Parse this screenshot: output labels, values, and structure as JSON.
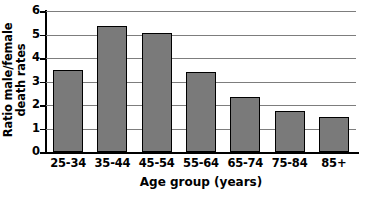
{
  "chart_data": {
    "type": "bar",
    "title": "",
    "xlabel": "Age group (years)",
    "ylabel": "Ratio male/female death rates",
    "ylabel_line1": "Ratio male/female",
    "ylabel_line2": "death rates",
    "categories": [
      "25-34",
      "35-44",
      "45-54",
      "55-64",
      "65-74",
      "75-84",
      "85+"
    ],
    "values": [
      3.5,
      5.35,
      5.05,
      3.4,
      2.35,
      1.75,
      1.5
    ],
    "ylim": [
      0,
      6
    ],
    "yticks": [
      0,
      1,
      2,
      3,
      4,
      5,
      6
    ],
    "ytick_labels": [
      "0",
      "1",
      "2",
      "3",
      "4",
      "5",
      "6"
    ],
    "grid": true,
    "grid_axis": "y",
    "legend": null,
    "bar_color": "#7a7a7a",
    "bar_edge_color": "#000000",
    "grid_color": "#7d7d7d",
    "axis_color": "#000000",
    "background_color": "#ffffff"
  }
}
